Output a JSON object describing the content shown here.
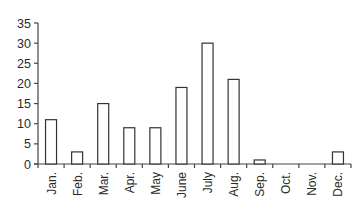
{
  "chart_data": {
    "type": "bar",
    "title": "",
    "xlabel": "",
    "ylabel": "",
    "categories": [
      "Jan.",
      "Feb.",
      "Mar.",
      "Apr.",
      "May",
      "June",
      "July",
      "Aug.",
      "Sep.",
      "Oct.",
      "Nov.",
      "Dec."
    ],
    "values": [
      11,
      3,
      15,
      9,
      9,
      19,
      30,
      21,
      1,
      0,
      0,
      3
    ],
    "ylim": [
      0,
      35
    ],
    "yticks": [
      0,
      5,
      10,
      15,
      20,
      25,
      30,
      35
    ],
    "grid": false,
    "legend": null,
    "bar_fill": "#ffffff",
    "bar_stroke": "#333333"
  }
}
